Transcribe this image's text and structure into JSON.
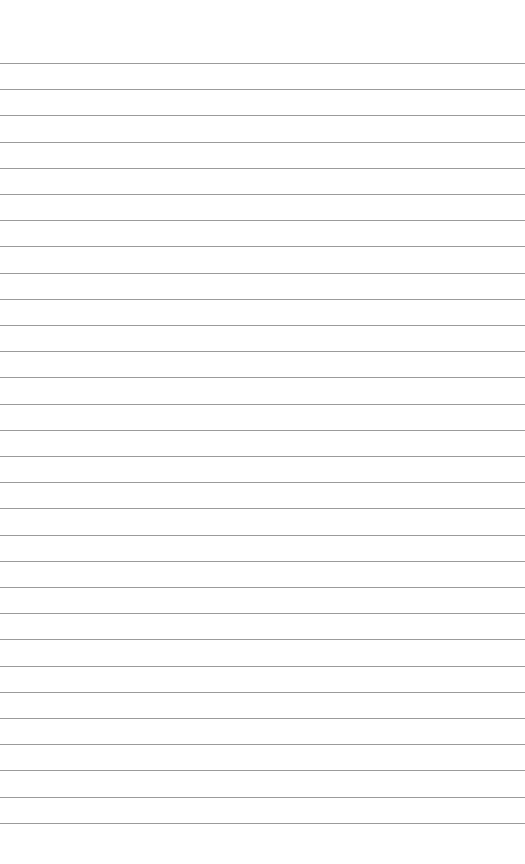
{
  "page": {
    "type": "lined-paper",
    "background": "#ffffff",
    "line_color": "#8a8a8a",
    "line_count": 30,
    "first_line_y": 63,
    "line_spacing": 26.2
  }
}
